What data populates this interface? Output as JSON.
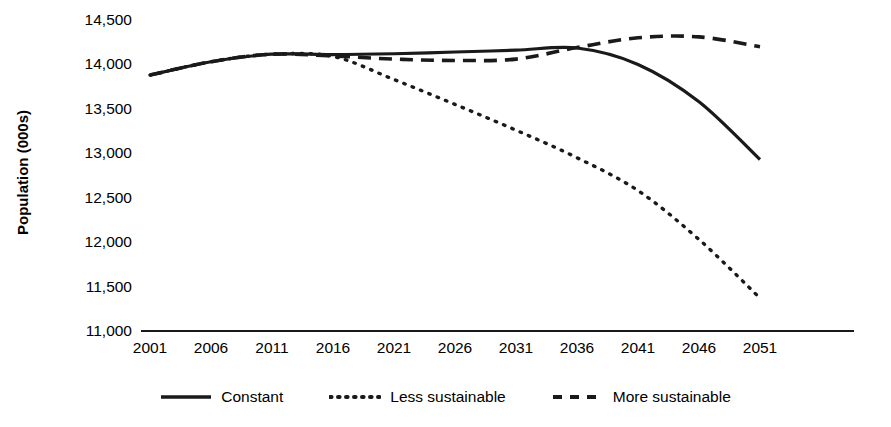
{
  "chart_data": {
    "type": "line",
    "title": "",
    "xlabel": "",
    "ylabel": "Population (000s)",
    "categories": [
      2001,
      2006,
      2011,
      2016,
      2021,
      2026,
      2031,
      2036,
      2041,
      2046,
      2051
    ],
    "x": [
      2001,
      2006,
      2011,
      2016,
      2021,
      2026,
      2031,
      2036,
      2041,
      2046,
      2051
    ],
    "xlim": [
      2001,
      2051
    ],
    "ylim": [
      11000,
      14500
    ],
    "yticks": [
      "11,000",
      "11,500",
      "12,000",
      "12,500",
      "13,000",
      "13,500",
      "14,000",
      "14,500"
    ],
    "ytick_values": [
      11000,
      11500,
      12000,
      12500,
      13000,
      13500,
      14000,
      14500
    ],
    "xticks": [
      "2001",
      "2006",
      "2011",
      "2016",
      "2021",
      "2026",
      "2031",
      "2036",
      "2041",
      "2046",
      "2051"
    ],
    "grid": false,
    "legend_position": "bottom",
    "series": [
      {
        "name": "Constant",
        "style": "solid",
        "color": "#1a1a1a",
        "values": [
          13880,
          14030,
          14115,
          14110,
          14120,
          14140,
          14160,
          14185,
          14000,
          13580,
          12930
        ]
      },
      {
        "name": "Less sustainable",
        "style": "dotted",
        "color": "#1a1a1a",
        "values": [
          13880,
          14030,
          14115,
          14090,
          13830,
          13550,
          13260,
          12950,
          12580,
          12030,
          11370
        ]
      },
      {
        "name": "More sustainable",
        "style": "dashed",
        "color": "#1a1a1a",
        "values": [
          13880,
          14030,
          14115,
          14095,
          14060,
          14045,
          14060,
          14190,
          14300,
          14310,
          14200
        ]
      }
    ]
  },
  "legend": {
    "items": [
      {
        "label": "Constant",
        "style": "solid"
      },
      {
        "label": "Less sustainable",
        "style": "dotted"
      },
      {
        "label": "More sustainable",
        "style": "dashed"
      }
    ]
  }
}
